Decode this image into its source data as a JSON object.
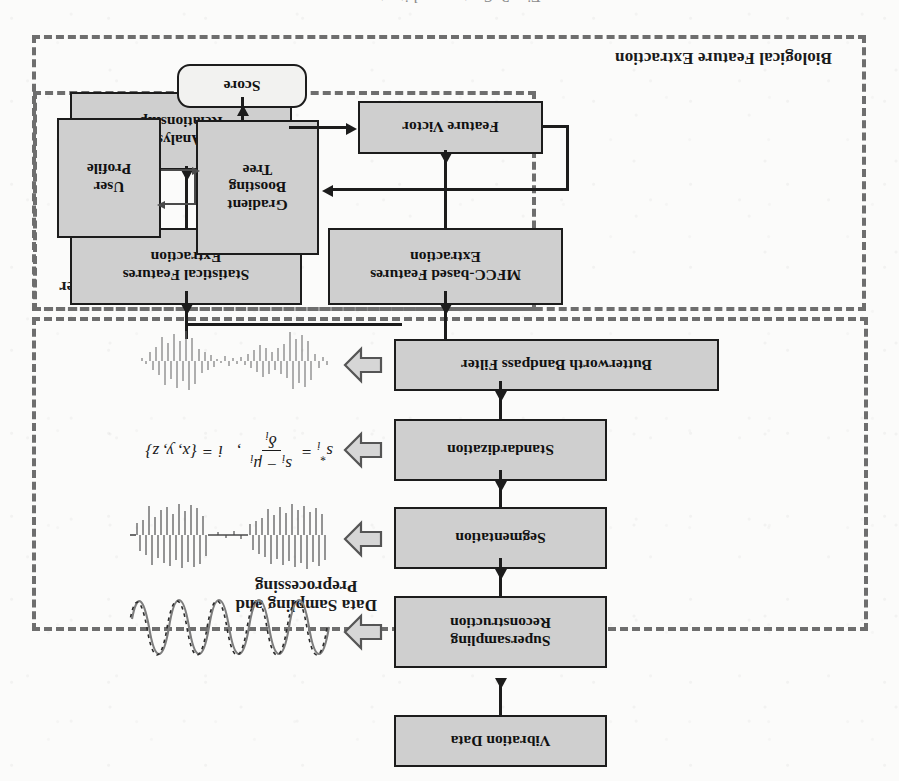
{
  "figure": {
    "caption_fragment": "Fig. 3.  System architecture",
    "orientation_note": "rotated-180",
    "colors": {
      "page_background": "#fbfbfa",
      "box_fill": "#cfcfcf",
      "box_border": "#1c1c1c",
      "group_border": "#6e6e6e",
      "block_arrow": "#6a6a6a",
      "text": "#111111"
    }
  },
  "groups": [
    {
      "id": "preprocessing",
      "label": "Data Sampling and\nPreprocessing"
    },
    {
      "id": "bio-feature",
      "label": "Biological Feature Extraction"
    },
    {
      "id": "classifier",
      "label": "Classifier"
    }
  ],
  "boxes": {
    "vibration_data": "Vibration Data",
    "supersampling": "Supersampling\nReconstruction",
    "segmentation": "Segmentation",
    "standardization": "Standardization",
    "butterworth": "Butterworth Bandpass Filter",
    "statistical_features": "Statistical Features\nExtraction",
    "mfcc_features": "MFCC-based Features\nExtraction",
    "pca": "PCA Analyse the\nRelationship",
    "feature_vector": "Feature Victor",
    "gradient_boosting_tree": "Gradient\nBoosting\nTree",
    "user_profile": "User\nProfile",
    "score": "Score"
  },
  "formula": {
    "lhs": "s",
    "lhs_sub": "i",
    "lhs_star": "*",
    "eq": "=",
    "numerator_s": "s",
    "numerator_sub": "i",
    "numerator_minus": "−",
    "numerator_mu": "μ",
    "numerator_mu_sub": "i",
    "denominator": "δ",
    "denominator_sub": "i",
    "comma": ",",
    "index_var": "i",
    "index_eq": "=",
    "index_set": "{x, y, z}"
  },
  "thumbnails": {
    "supersampling_wave": "sine-wave-reconstruction-thumbnail",
    "segmentation_wave": "segmented-burst-waveform-thumbnail",
    "filtered_wave": "bandpass-filtered-waveform-thumbnail"
  },
  "block_arrows": {
    "to_supersampling_wave": "hollow-block-arrow-right",
    "to_segmentation_wave": "hollow-block-arrow-right",
    "to_formula": "hollow-block-arrow-right",
    "to_filtered_wave": "hollow-block-arrow-right"
  }
}
